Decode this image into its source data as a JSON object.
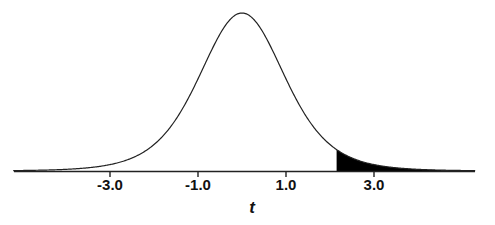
{
  "chart_data": {
    "type": "area",
    "title": "",
    "xlabel": "t",
    "ylabel": "",
    "distribution": "t-distribution density curve",
    "x_range": [
      -5.2,
      5.3
    ],
    "x_ticks": [
      -3.0,
      -1.0,
      1.0,
      3.0
    ],
    "x_tick_labels": [
      "-3.0",
      "-1.0",
      "1.0",
      "3.0"
    ],
    "shaded_region": {
      "from": 2.15,
      "to": 5.3,
      "color": "#000000",
      "description": "upper tail"
    },
    "grid": false,
    "legend": null,
    "colors": {
      "curve": "#222222",
      "fill": "#000000",
      "axis": "#222222"
    }
  }
}
